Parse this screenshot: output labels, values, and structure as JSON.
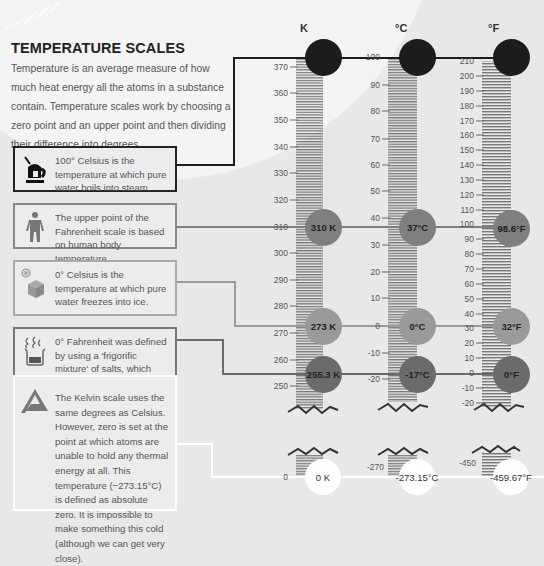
{
  "title": "TEMPERATURE SCALES",
  "intro": "Temperature is an average measure of how much heat energy all the atoms in a substance contain. Temperature scales work by choosing a zero point and an upper point and then dividing their difference into degrees.",
  "boxes": [
    {
      "icon": "kettle-icon",
      "text": "100° Celsius is the temperature at which pure water boils into steam."
    },
    {
      "icon": "person-icon",
      "text": "The upper point of the Fahrenheit scale is based on human body temperature."
    },
    {
      "icon": "ice-cube-icon",
      "text": "0° Celsius is the temperature at which pure water freezes into ice."
    },
    {
      "icon": "beaker-icon",
      "text": "0° Fahrenheit was defined by using a 'frigorific mixture' of salts, which freeze when mixed."
    },
    {
      "icon": "kelvin-a-icon",
      "text": "The Kelvin scale uses the same degrees as Celsius. However, zero is set at the point at which atoms are unable to hold any thermal energy at all. This temperature (−273.15°C) is defined as absolute zero. It is impossible to make something this cold (although we can get very close)."
    }
  ],
  "scales": {
    "kelvin": {
      "header": "K",
      "ticks": [
        "370",
        "360",
        "350",
        "340",
        "330",
        "320",
        "310",
        "300",
        "290",
        "280",
        "270",
        "260",
        "250"
      ],
      "bottom_tick": "0",
      "markers": [
        "373 K",
        "310 K",
        "273 K",
        "255.3 K"
      ],
      "zero": "0 K"
    },
    "celsius": {
      "header": "°C",
      "ticks": [
        "100",
        "90",
        "80",
        "70",
        "60",
        "50",
        "40",
        "30",
        "20",
        "10",
        "0",
        "-10",
        "-20"
      ],
      "bottom_tick": "-270",
      "markers": [
        "100°C",
        "37°C",
        "0°C",
        "-17°C"
      ],
      "zero": "-273.15°C"
    },
    "fahrenheit": {
      "header": "°F",
      "ticks": [
        "210",
        "200",
        "190",
        "180",
        "170",
        "160",
        "150",
        "140",
        "130",
        "120",
        "110",
        "100",
        "90",
        "80",
        "70",
        "60",
        "50",
        "40",
        "30",
        "20",
        "10",
        "0",
        "-10",
        "-20"
      ],
      "bottom_tick": "-450",
      "markers": [
        "212°F",
        "98.6°F",
        "32°F",
        "0°F"
      ],
      "zero": "-459.67°F"
    }
  },
  "colors": {
    "boiling": "#1c1c1c",
    "body": "#7f7f7f",
    "freezing": "#9a9a9a",
    "frigorific": "#6b6b6b",
    "absolute_zero": "#ffffff",
    "background": "#e8e8e8"
  }
}
